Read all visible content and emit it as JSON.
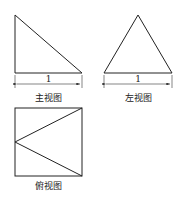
{
  "views": {
    "front": {
      "caption": "主视图",
      "dimension": "1"
    },
    "left": {
      "caption": "左视图",
      "dimension": "1"
    },
    "top": {
      "caption": "俯视图"
    }
  },
  "colors": {
    "line": "#222222",
    "background": "#ffffff"
  }
}
